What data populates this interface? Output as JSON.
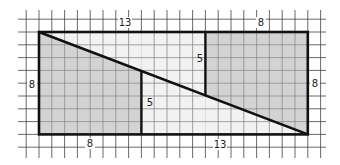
{
  "diagram": {
    "grid": {
      "unit_px": 12.8,
      "origin_x": 39,
      "origin_y": 32,
      "cols_min": -2,
      "cols_max": 23,
      "rows_min": -2,
      "rows_max": 10
    },
    "outer_rect": {
      "x": 0,
      "y": 0,
      "w": 21,
      "h": 8
    },
    "colors": {
      "shaded": "#d6d6d6",
      "light": "#f0f0f0",
      "line": "#111111",
      "grid": "#333333"
    },
    "labels": {
      "top_left": "13",
      "top_right": "8",
      "left": "8",
      "right": "8",
      "bottom_left": "8",
      "bottom_right": "13",
      "inner_left_segment": "5",
      "inner_right_segment": "5"
    }
  }
}
